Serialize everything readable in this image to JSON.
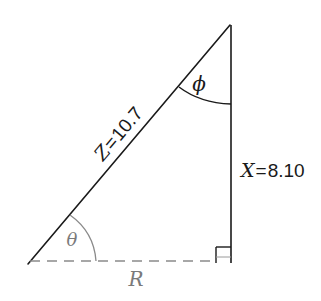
{
  "diagram": {
    "type": "right-triangle-impedance",
    "colors": {
      "stroke": "#1a1a1a",
      "muted": "#7a7a7a",
      "background": "#ffffff"
    },
    "hypotenuse": {
      "symbol": "Z",
      "equals": "=",
      "value": "10.7",
      "label": "Z=10.7"
    },
    "vertical_side": {
      "symbol": "X",
      "equals": "=",
      "value": "8.10",
      "label": "X=8.10"
    },
    "base_side": {
      "symbol": "R",
      "style": "dashed"
    },
    "angles": {
      "bottom_left": "θ",
      "top": "ϕ",
      "bottom_right": "right-angle"
    }
  }
}
